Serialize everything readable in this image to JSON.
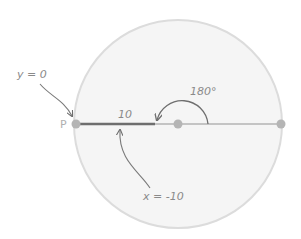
{
  "diagram": {
    "type": "polar-coordinate-illustration",
    "circle": {
      "cx": 178,
      "cy": 124,
      "r": 104,
      "fill": "#f5f5f5",
      "stroke": "#dcdcdc"
    },
    "points": {
      "p": {
        "label": "P",
        "x": 76,
        "y": 124
      },
      "center": {
        "x": 178,
        "y": 124
      },
      "right": {
        "x": 281,
        "y": 124
      }
    },
    "segment_label": "10",
    "angle_label": "180°",
    "annotations": {
      "y_label": "y = 0",
      "x_label": "x = -10"
    },
    "colors": {
      "bold_line": "#6e6e6e",
      "thin_line": "#c4c4c4",
      "point": "#b5b5b5",
      "text": "#8a8a8a",
      "arrow": "#7a7a7a"
    }
  }
}
